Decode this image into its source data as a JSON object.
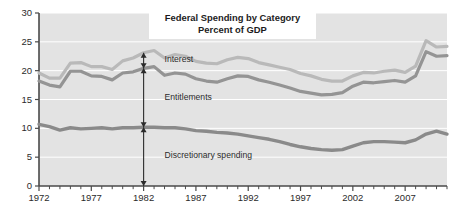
{
  "chart_data": {
    "type": "line",
    "title": "Federal Spending by Category",
    "subtitle": "Percent of GDP",
    "xlabel": "",
    "ylabel": "",
    "xlim": [
      1972,
      2011
    ],
    "ylim": [
      0,
      30
    ],
    "yticks": [
      0,
      5,
      10,
      15,
      20,
      25,
      30
    ],
    "xticks": [
      1972,
      1977,
      1982,
      1987,
      1992,
      1997,
      2002,
      2007
    ],
    "xtick_minor_step": 1,
    "grid": "horizontal-white",
    "legend": "none",
    "colors": {
      "total": "#b9b9b9",
      "entitlements_plus_discretionary": "#949494",
      "discretionary": "#8a8a8a",
      "plot_background": "#e3e3e3",
      "axis": "#4a4a4a",
      "text": "#2b2b2b",
      "gridline": "#ffffff",
      "title_box": "#ffffff"
    },
    "x": [
      1972,
      1973,
      1974,
      1975,
      1976,
      1977,
      1978,
      1979,
      1980,
      1981,
      1982,
      1983,
      1984,
      1985,
      1986,
      1987,
      1988,
      1989,
      1990,
      1991,
      1992,
      1993,
      1994,
      1995,
      1996,
      1997,
      1998,
      1999,
      2000,
      2001,
      2002,
      2003,
      2004,
      2005,
      2006,
      2007,
      2008,
      2009,
      2010,
      2011
    ],
    "series": [
      {
        "name": "Total spending (upper boundary of Interest band)",
        "stacking": "cumulative-top",
        "values": [
          19.6,
          18.7,
          18.7,
          21.3,
          21.4,
          20.7,
          20.7,
          20.2,
          21.7,
          22.2,
          23.1,
          23.5,
          22.2,
          22.8,
          22.5,
          21.6,
          21.3,
          21.2,
          21.9,
          22.3,
          22.1,
          21.4,
          21.0,
          20.6,
          20.2,
          19.5,
          19.1,
          18.5,
          18.2,
          18.2,
          19.1,
          19.7,
          19.6,
          19.9,
          20.1,
          19.7,
          20.8,
          25.2,
          24.1,
          24.2
        ]
      },
      {
        "name": "Entitlements + discretionary (upper boundary of Entitlements band)",
        "stacking": "cumulative-mid",
        "values": [
          18.2,
          17.5,
          17.2,
          19.9,
          19.9,
          19.1,
          19.0,
          18.4,
          19.6,
          19.8,
          20.4,
          20.7,
          19.2,
          19.6,
          19.4,
          18.6,
          18.2,
          18.0,
          18.6,
          19.1,
          19.0,
          18.4,
          18.0,
          17.5,
          17.0,
          16.4,
          16.1,
          15.8,
          15.9,
          16.2,
          17.3,
          18.0,
          17.9,
          18.1,
          18.3,
          18.0,
          19.1,
          23.3,
          22.5,
          22.6
        ]
      },
      {
        "name": "Discretionary spending (upper boundary of Discretionary band)",
        "stacking": "cumulative-bottom",
        "values": [
          10.7,
          10.3,
          9.7,
          10.1,
          9.9,
          10.0,
          10.1,
          9.9,
          10.1,
          10.1,
          10.2,
          10.2,
          10.1,
          10.1,
          9.9,
          9.6,
          9.5,
          9.3,
          9.2,
          9.0,
          8.7,
          8.4,
          8.1,
          7.7,
          7.2,
          6.8,
          6.5,
          6.3,
          6.2,
          6.3,
          6.9,
          7.5,
          7.7,
          7.7,
          7.6,
          7.5,
          8.0,
          9.0,
          9.5,
          9.0
        ]
      }
    ],
    "annotations": [
      {
        "label": "Interest",
        "type": "double-arrow-vertical",
        "at_x": 1982,
        "from_y": 20.4,
        "to_y": 23.1,
        "label_x": 1984,
        "label_y": 21.5
      },
      {
        "label": "Entitlements",
        "type": "double-arrow-vertical",
        "at_x": 1982,
        "from_y": 10.2,
        "to_y": 20.4,
        "label_x": 1984,
        "label_y": 14.9
      },
      {
        "label": "Discretionary spending",
        "type": "double-arrow-vertical",
        "at_x": 1982,
        "from_y": 0,
        "to_y": 10.2,
        "label_x": 1984,
        "label_y": 4.9
      }
    ]
  }
}
